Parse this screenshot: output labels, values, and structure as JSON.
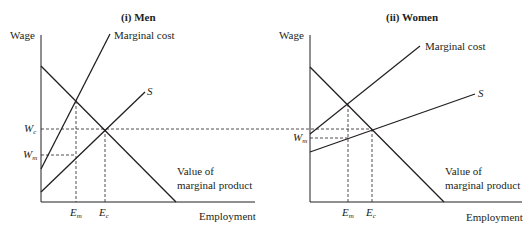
{
  "panels": [
    {
      "title": "(i)  Men",
      "y_label": "Wage",
      "x_label": "Employment",
      "curves": {
        "marginal_cost": "Marginal cost",
        "supply": "S",
        "vmp_line1": "Value of",
        "vmp_line2": "marginal product"
      },
      "y_ticks": [
        {
          "main": "W",
          "sub": "c"
        },
        {
          "main": "W",
          "sub": "m"
        }
      ],
      "x_ticks": [
        {
          "main": "E",
          "sub": "m"
        },
        {
          "main": "E",
          "sub": "c"
        }
      ]
    },
    {
      "title": "(ii)  Women",
      "y_label": "Wage",
      "x_label": "Employment",
      "curves": {
        "marginal_cost": "Marginal cost",
        "supply": "S",
        "vmp_line1": "Value of",
        "vmp_line2": "marginal product"
      },
      "y_ticks": [
        {
          "main": "W",
          "sub": "m"
        }
      ],
      "x_ticks": [
        {
          "main": "E",
          "sub": "m"
        },
        {
          "main": "E",
          "sub": "c"
        }
      ]
    }
  ],
  "colors": {
    "line": "#231f20",
    "background": "#ffffff"
  }
}
